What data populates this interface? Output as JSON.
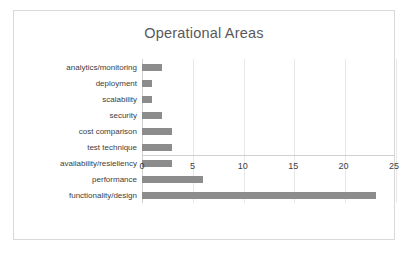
{
  "chart_data": {
    "type": "bar",
    "orientation": "horizontal",
    "title": "Operational Areas",
    "xlabel": "",
    "ylabel": "",
    "xlim": [
      0,
      25
    ],
    "xticks": [
      0,
      5,
      10,
      15,
      20,
      25
    ],
    "grid": "vertical",
    "legend": null,
    "bar_color": "#8c8c8c",
    "categories": [
      "analytics/monitoring",
      "deployment",
      "scalability",
      "security",
      "cost comparison",
      "test technique",
      "availability/resieliency",
      "performance",
      "functionality/design"
    ],
    "values": [
      2,
      1,
      1,
      2,
      3,
      3,
      3,
      6,
      23
    ]
  }
}
